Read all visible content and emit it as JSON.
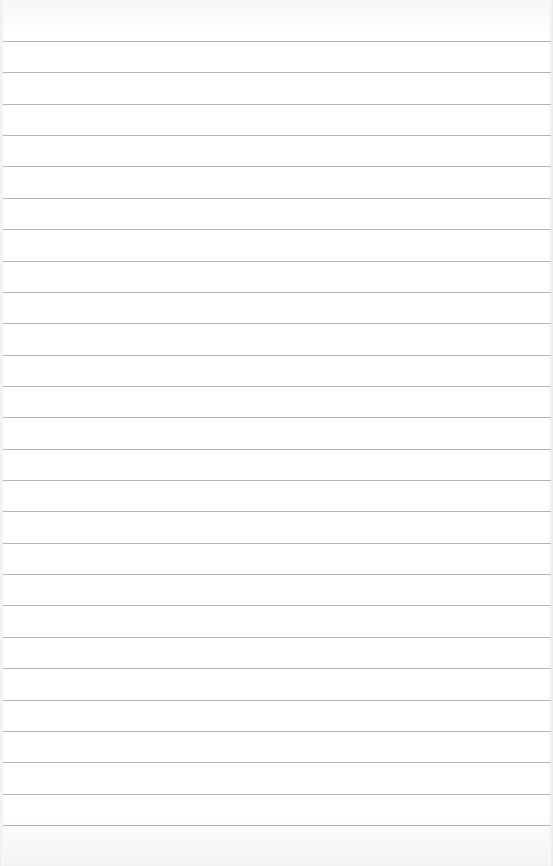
{
  "page": {
    "type": "blank ruled paper",
    "background_color": "#ffffff",
    "rule_color": "#a9a9a9",
    "rule_count": 26,
    "first_rule_y": 41,
    "rule_spacing": 31.36
  }
}
